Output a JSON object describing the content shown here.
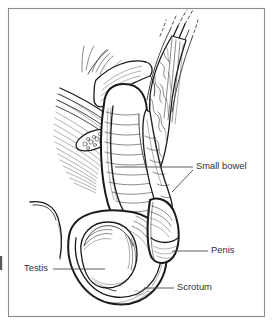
{
  "figure": {
    "background_color": "#ffffff",
    "frame_color": "#8c8c8c",
    "ink_color": "#1a1a1a",
    "label_color": "#333333",
    "frame": {
      "x": 8,
      "y": 8,
      "width": 257,
      "height": 309
    }
  },
  "labels": [
    {
      "id": "small-bowel",
      "text": "Small bowel",
      "text_x": 196,
      "text_y": 167,
      "leaders": [
        {
          "points": "115,167 193,167"
        },
        {
          "points": "193,170 172,192"
        }
      ]
    },
    {
      "id": "penis",
      "text": "Penis",
      "text_x": 211,
      "text_y": 251,
      "leaders": [
        {
          "points": "172,251 208,251"
        }
      ]
    },
    {
      "id": "scrotum",
      "text": "Scrotum",
      "text_x": 177,
      "text_y": 288,
      "leaders": [
        {
          "points": "144,288 174,288"
        }
      ]
    },
    {
      "id": "testis",
      "text": "Testis",
      "text_x": 24,
      "text_y": 269,
      "leaders": [
        {
          "points": "53,269 105,269"
        }
      ]
    }
  ],
  "structures": [
    {
      "id": "spermatic-cord",
      "name": "spermatic cord and fascial layers"
    },
    {
      "id": "herniated-bowel-loop",
      "name": "herniated small bowel loop"
    },
    {
      "id": "mesentery",
      "name": "mesentery with vessels"
    },
    {
      "id": "cut-section",
      "name": "cut cross-section of cord"
    },
    {
      "id": "scrotal-sac",
      "name": "scrotal sac"
    },
    {
      "id": "testis-body",
      "name": "testis"
    },
    {
      "id": "penis-shaft",
      "name": "penis shaft and glans"
    },
    {
      "id": "artist-signature",
      "name": "artist signature"
    }
  ]
}
